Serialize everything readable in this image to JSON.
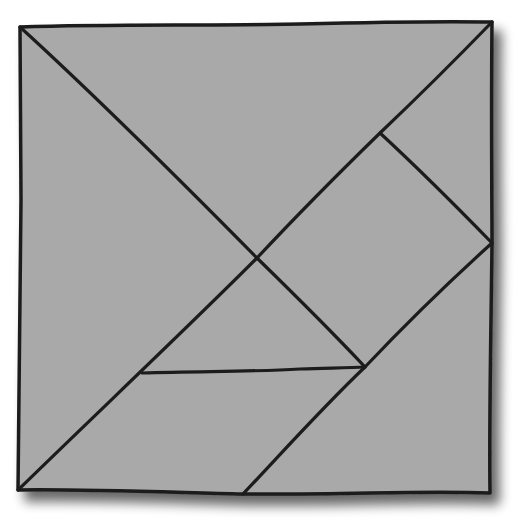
{
  "diagram": {
    "type": "tangram",
    "colors": {
      "background": "#ffffff",
      "fill": "#a9a9a9",
      "stroke": "#1c1c1c",
      "shadow": "#6a6a6a"
    },
    "square": {
      "top_left": [
        20,
        27
      ],
      "top_right": [
        492,
        22
      ],
      "bottom_right": [
        490,
        493
      ],
      "bottom_left": [
        18,
        490
      ]
    },
    "key_points": {
      "center": [
        257,
        258
      ],
      "upper_right_junction": [
        380,
        133
      ],
      "right_edge_mid": [
        492,
        243
      ],
      "triangle_bottom_right": [
        365,
        367
      ],
      "horizontal_left": [
        142,
        373
      ],
      "bottom_mid": [
        243,
        494
      ]
    },
    "pieces": [
      {
        "name": "large-triangle-top",
        "points": "20,27 492,22 257,258"
      },
      {
        "name": "large-triangle-left",
        "points": "20,27 257,258 18,490"
      },
      {
        "name": "small-triangle-corner",
        "points": "380,133 492,22 492,243"
      },
      {
        "name": "square-piece",
        "points": "257,258 380,133 492,243 365,367"
      },
      {
        "name": "small-triangle-middle",
        "points": "257,258 365,367 142,373"
      },
      {
        "name": "parallelogram",
        "points": "18,490 142,373 365,367 243,494"
      },
      {
        "name": "medium-triangle",
        "points": "243,494 492,243 490,493"
      }
    ]
  }
}
